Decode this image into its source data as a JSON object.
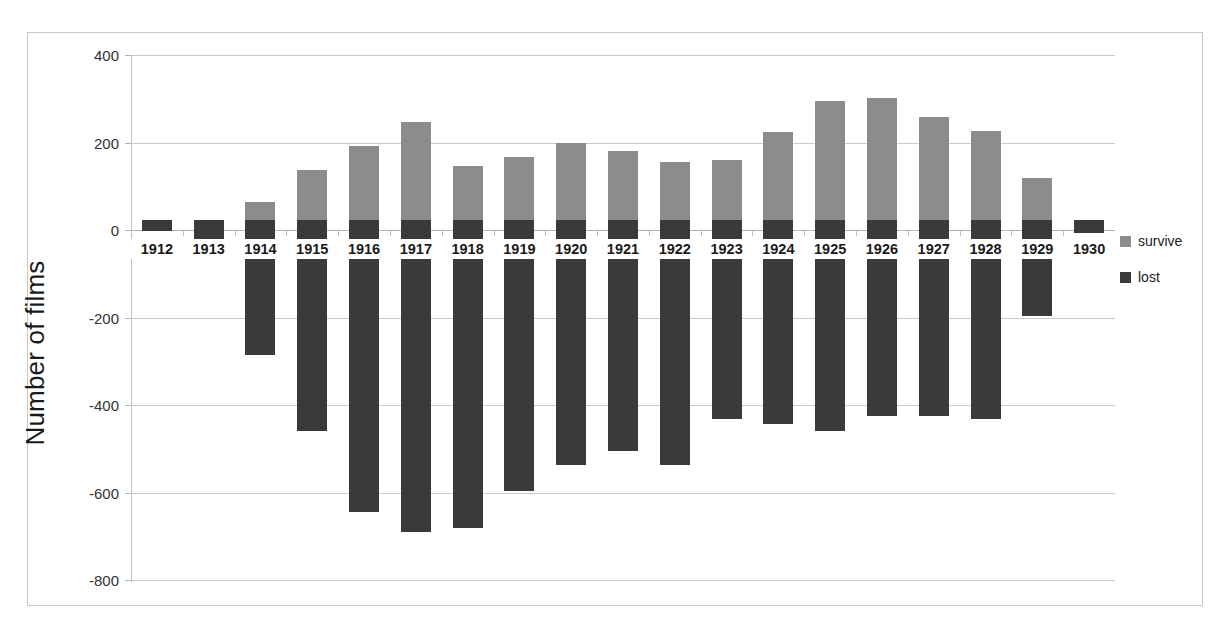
{
  "chart_data": {
    "type": "bar",
    "title": "",
    "subtitle": "",
    "xlabel": "",
    "ylabel": "Number of films",
    "ylim": [
      -800,
      400
    ],
    "yticks": [
      400,
      200,
      0,
      -200,
      -400,
      -600,
      -800
    ],
    "ytick_labels": [
      "400",
      "200",
      "0",
      "-200",
      "-400",
      "-600",
      "-800"
    ],
    "grid": true,
    "stacked": true,
    "orientation": "vertical",
    "legend_position": "right",
    "categories": [
      "1912",
      "1913",
      "1914",
      "1915",
      "1916",
      "1917",
      "1918",
      "1919",
      "1920",
      "1921",
      "1922",
      "1923",
      "1924",
      "1925",
      "1926",
      "1927",
      "1928",
      "1929",
      "1930"
    ],
    "series": [
      {
        "name": "survive",
        "color": "#8c8c8c",
        "values": [
          7,
          22,
          65,
          138,
          192,
          248,
          146,
          166,
          198,
          180,
          155,
          159,
          224,
          294,
          302,
          259,
          226,
          118,
          6
        ]
      },
      {
        "name": "lost",
        "color": "#3a3a3a",
        "values": [
          -3,
          -22,
          -285,
          -460,
          -645,
          -690,
          -682,
          -597,
          -537,
          -506,
          -538,
          -432,
          -443,
          -459,
          -424,
          -426,
          -433,
          -197,
          -7
        ]
      }
    ]
  },
  "legend": {
    "items": [
      {
        "label": "survive",
        "color": "#8c8c8c"
      },
      {
        "label": "lost",
        "color": "#3a3a3a"
      }
    ]
  },
  "axis": {
    "y_title": "Number of films"
  }
}
